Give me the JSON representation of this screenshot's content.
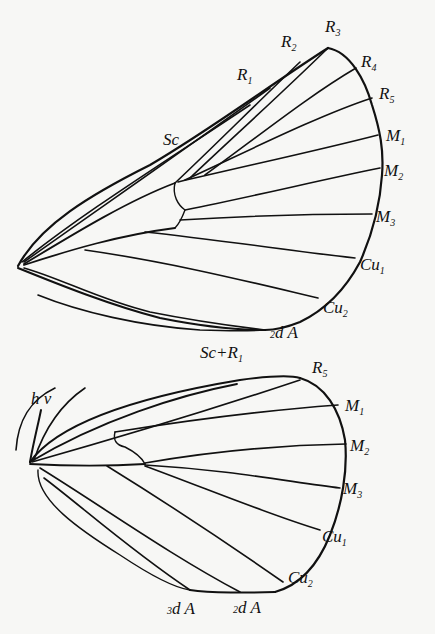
{
  "figure": {
    "forewing": {
      "labels": {
        "Sc": {
          "main": "Sc",
          "sub": ""
        },
        "R1": {
          "main": "R",
          "sub": "1"
        },
        "R2": {
          "main": "R",
          "sub": "2"
        },
        "R3": {
          "main": "R",
          "sub": "3"
        },
        "R4": {
          "main": "R",
          "sub": "4"
        },
        "R5": {
          "main": "R",
          "sub": "5"
        },
        "M1": {
          "main": "M",
          "sub": "1"
        },
        "M2": {
          "main": "M",
          "sub": "2"
        },
        "M3": {
          "main": "M",
          "sub": "3"
        },
        "Cu1": {
          "main": "Cu",
          "sub": "1"
        },
        "Cu2": {
          "main": "Cu",
          "sub": "2"
        },
        "A2": {
          "pre": "2",
          "main": "d A"
        }
      }
    },
    "hindwing": {
      "labels": {
        "ScR1": {
          "main": "Sc+R",
          "sub": "1"
        },
        "hv": {
          "main": "h v"
        },
        "R5": {
          "main": "R",
          "sub": "5"
        },
        "M1": {
          "main": "M",
          "sub": "1"
        },
        "M2": {
          "main": "M",
          "sub": "2"
        },
        "M3": {
          "main": "M",
          "sub": "3"
        },
        "Cu1": {
          "main": "Cu",
          "sub": "1"
        },
        "Cu2": {
          "main": "Cu",
          "sub": "2"
        },
        "A2": {
          "pre": "2",
          "main": "d A"
        },
        "A3": {
          "pre": "3",
          "main": "d A"
        }
      }
    }
  }
}
